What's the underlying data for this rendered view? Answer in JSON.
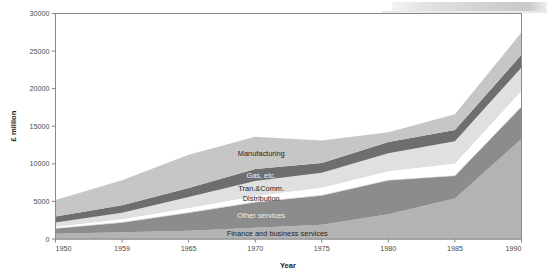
{
  "figure": {
    "name": "stacked-area-chart",
    "background": "#ffffff",
    "top_decoration_color": "#d2d2d2"
  },
  "chart_data": {
    "type": "area",
    "stacked": true,
    "title": "",
    "subtitle": "",
    "xlabel": "Year",
    "ylabel": "£ million",
    "x": [
      1950,
      1959,
      1965,
      1970,
      1975,
      1980,
      1985,
      1990
    ],
    "xtick_labels": [
      "1950",
      "1959",
      "1965",
      "1970",
      "1975",
      "1980",
      "1985",
      "1990"
    ],
    "ytick_labels": [
      "0",
      "5000",
      "10000",
      "15000",
      "20000",
      "25000",
      "30000"
    ],
    "ytick_values": [
      0,
      5000,
      10000,
      15000,
      20000,
      25000,
      30000
    ],
    "xlim": [
      1950,
      1990
    ],
    "ylim": [
      0,
      30000
    ],
    "grid": false,
    "legend_position": "inline-labels",
    "axis_color": "#808080",
    "series": [
      {
        "name": "Finance and business services",
        "label": "Finance and business services",
        "color": "#b3b3b3",
        "values": [
          700,
          900,
          1100,
          1500,
          1900,
          3300,
          5400,
          13300
        ]
      },
      {
        "name": "Other services",
        "label": "Other services",
        "color": "#8c8c8c",
        "values": [
          700,
          1300,
          2400,
          3400,
          3900,
          4500,
          3000,
          4300
        ]
      },
      {
        "name": "Distribution",
        "label": "Distribution",
        "color": "#ffffff",
        "values": [
          300,
          500,
          700,
          900,
          1100,
          1300,
          1700,
          2200
        ]
      },
      {
        "name": "Tran.&Comm.",
        "label": "Tran.&Comm.",
        "color": "#e0e0e0",
        "values": [
          500,
          800,
          1400,
          1900,
          1900,
          2300,
          2900,
          3000
        ]
      },
      {
        "name": "Gas, etc.",
        "label": "Gas, etc.",
        "color": "#6e6e6e",
        "values": [
          800,
          1000,
          1200,
          1600,
          1300,
          1500,
          1500,
          1700
        ]
      },
      {
        "name": "Manufacturing",
        "label": "Manufacturing",
        "color": "#c6c6c6",
        "values": [
          2200,
          3300,
          4400,
          4300,
          3000,
          1300,
          2100,
          3000
        ]
      }
    ],
    "totals": [
      5200,
      7800,
      11200,
      13600,
      13100,
      14200,
      16600,
      27500
    ]
  },
  "axis": {
    "y_title": "£ million",
    "x_title": "Year"
  }
}
